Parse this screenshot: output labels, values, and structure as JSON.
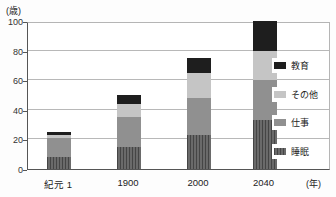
{
  "chart_data": {
    "type": "bar",
    "stacked": true,
    "title": "",
    "y_axis_unit": "(歳)",
    "x_axis_unit": "(年)",
    "categories": [
      "紀元 1",
      "1900",
      "2000",
      "2040"
    ],
    "series": [
      {
        "name": "睡眠",
        "values": [
          8,
          15,
          23,
          33
        ],
        "color": "#5f5f5f",
        "pattern": "vertical-stripes"
      },
      {
        "name": "仕事",
        "values": [
          13,
          20,
          25,
          27
        ],
        "color": "#909090",
        "pattern": "solid"
      },
      {
        "name": "その他",
        "values": [
          2,
          9,
          17,
          20
        ],
        "color": "#c5c5c5",
        "pattern": "solid"
      },
      {
        "name": "教育",
        "values": [
          2,
          6,
          10,
          20
        ],
        "color": "#1e1e1e",
        "pattern": "solid"
      }
    ],
    "totals": [
      25,
      50,
      75,
      100
    ],
    "ylim": [
      0,
      100
    ],
    "yticks": [
      0,
      20,
      40,
      60,
      80,
      100
    ],
    "legend_order": [
      "教育",
      "その他",
      "仕事",
      "睡眠"
    ],
    "legend_position": "right-inside",
    "grid": true
  }
}
